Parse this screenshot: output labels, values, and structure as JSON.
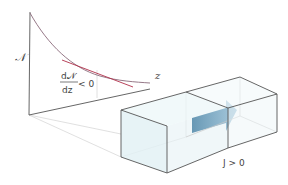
{
  "diagram": {
    "y_axis_label": "𝒩",
    "z_axis_label": "z",
    "gradient_label": {
      "numerator": "d𝒩",
      "denominator": "dz",
      "relation": "< 0"
    },
    "flux_label": "J > 0"
  },
  "colors": {
    "axis": "#555555",
    "curve": "#8a6a7a",
    "tangent": "#b0304a",
    "box_edge": "#555555",
    "box_edge_hidden": "#c8c8c8",
    "box_fill": "#e6f3f6",
    "arrow": "#5f95b5",
    "text": "#444444"
  }
}
